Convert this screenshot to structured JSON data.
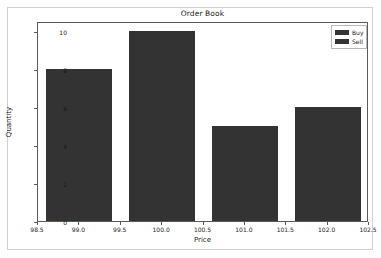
{
  "chart_data": {
    "type": "bar",
    "title": "Order Book",
    "xlabel": "Price",
    "ylabel": "Quantity",
    "xlim": [
      98.5,
      102.5
    ],
    "ylim": [
      0,
      10.5
    ],
    "grid": false,
    "legend_position": "upper right",
    "xticks": [
      "98.5",
      "99.0",
      "99.5",
      "100.0",
      "100.5",
      "101.0",
      "101.5",
      "102.0",
      "102.5"
    ],
    "xtick_values": [
      98.5,
      99.0,
      99.5,
      100.0,
      100.5,
      101.0,
      101.5,
      102.0,
      102.5
    ],
    "yticks": [
      "0",
      "2",
      "4",
      "6",
      "8",
      "10"
    ],
    "ytick_values": [
      0,
      2,
      4,
      6,
      8,
      10
    ],
    "bar_width": 0.8,
    "series": [
      {
        "name": "Buy",
        "color": "#333333",
        "x": [
          99.0,
          100.0
        ],
        "values": [
          8,
          10
        ]
      },
      {
        "name": "Sell",
        "color": "#333333",
        "x": [
          101.0,
          102.0
        ],
        "values": [
          5,
          6
        ]
      }
    ]
  },
  "legend": {
    "entries": [
      {
        "label": "Buy",
        "color": "#333333"
      },
      {
        "label": "Sell",
        "color": "#333333"
      }
    ]
  }
}
